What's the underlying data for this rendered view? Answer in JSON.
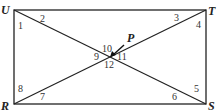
{
  "diagram": {
    "vertices": [
      {
        "name": "U",
        "x": 14,
        "y": 10
      },
      {
        "name": "T",
        "x": 206,
        "y": 10
      },
      {
        "name": "S",
        "x": 206,
        "y": 104
      },
      {
        "name": "R",
        "x": 14,
        "y": 104
      }
    ],
    "intersection": {
      "name": "P",
      "x": 110,
      "y": 57
    },
    "angle_labels": [
      "1",
      "2",
      "3",
      "4",
      "5",
      "6",
      "7",
      "8",
      "9",
      "10",
      "11",
      "12"
    ]
  }
}
